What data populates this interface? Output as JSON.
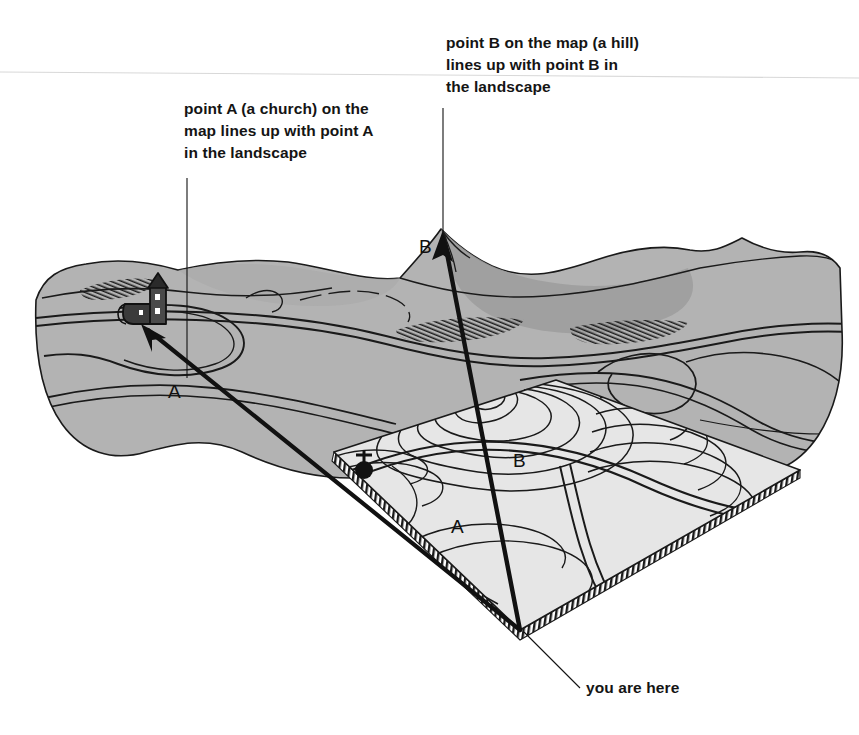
{
  "callouts": {
    "point_a": "point A (a church) on the\nmap lines up with point A\nin the landscape",
    "point_b": "point B on the map (a hill)\nlines up with point B in\nthe landscape",
    "you_are_here": "you are here"
  },
  "labels": {
    "landscape_a": "A",
    "landscape_b": "B",
    "map_a": "A",
    "map_b": "B"
  },
  "colors": {
    "terrain_fill": "#b3b3b3",
    "terrain_shadow": "#9a9a9a",
    "map_fill": "#e6e6e6",
    "ink": "#111111",
    "paper": "#ffffff"
  },
  "elements": {
    "church_symbol": "church-map-symbol",
    "hill_summit": "hill-contour-rings",
    "bearing_line_a": "sight-line-to-church",
    "bearing_line_b": "sight-line-to-hill",
    "observer": "observer-position"
  }
}
